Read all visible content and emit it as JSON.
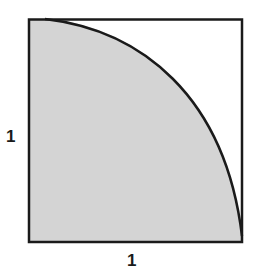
{
  "diagram": {
    "labels": {
      "left_side": "1",
      "bottom_side": "1"
    },
    "colors": {
      "shaded_region": "#d4d4d4",
      "outline": "#1a1a1a",
      "background": "#ffffff"
    },
    "shapes": {
      "square": {
        "side_length": 1
      },
      "quarter_circle": {
        "radius": 1,
        "center": "bottom-left corner",
        "shaded": true
      }
    }
  }
}
